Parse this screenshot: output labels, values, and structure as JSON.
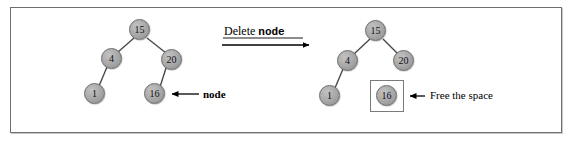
{
  "figure": {
    "caption_operation_prefix": "Delete",
    "caption_operation_target": "node",
    "frame": {
      "border_color": "#6f6f6f"
    },
    "node_fill": "#a6a6a6",
    "node_stroke": "#6a6a6a",
    "edge_color": "#4a4a4a",
    "arrow_color": "#000000"
  },
  "before": {
    "title": "binary-search-tree-before-delete",
    "nodes": [
      {
        "id": "b15",
        "label": "15",
        "x": 140,
        "y": 30
      },
      {
        "id": "b4",
        "label": "4",
        "x": 112,
        "y": 59
      },
      {
        "id": "b20",
        "label": "20",
        "x": 172,
        "y": 60
      },
      {
        "id": "b1",
        "label": "1",
        "x": 95,
        "y": 94
      },
      {
        "id": "b16",
        "label": "16",
        "x": 155,
        "y": 94
      }
    ],
    "edges": [
      {
        "from": "b15",
        "to": "b4"
      },
      {
        "from": "b15",
        "to": "b20"
      },
      {
        "from": "b4",
        "to": "b1"
      },
      {
        "from": "b20",
        "to": "b16"
      }
    ],
    "annotation": {
      "text": "node",
      "style": "mono-bold",
      "arrow_from_x": 199,
      "arrow_to_x": 170,
      "arrow_y": 94,
      "label_x": 202,
      "label_y": 90
    }
  },
  "after": {
    "title": "binary-search-tree-after-delete",
    "nodes": [
      {
        "id": "a15",
        "label": "15",
        "x": 376,
        "y": 31
      },
      {
        "id": "a4",
        "label": "4",
        "x": 348,
        "y": 61
      },
      {
        "id": "a20",
        "label": "20",
        "x": 404,
        "y": 61
      },
      {
        "id": "a1",
        "label": "1",
        "x": 330,
        "y": 96
      },
      {
        "id": "a16",
        "label": "16",
        "x": 387,
        "y": 96
      }
    ],
    "edges": [
      {
        "from": "a15",
        "to": "a4"
      },
      {
        "from": "a15",
        "to": "a20"
      },
      {
        "from": "a4",
        "to": "a1"
      }
    ],
    "detached_box": {
      "x": 370,
      "y": 80,
      "width": 34,
      "height": 32
    },
    "annotation": {
      "text": "Free the space",
      "style": "serif",
      "arrow_from_x": 425,
      "arrow_to_x": 408,
      "arrow_y": 96,
      "label_x": 430,
      "label_y": 91
    }
  },
  "transition": {
    "label_x": 224,
    "label_y": 27,
    "arrow_from_x": 222,
    "arrow_to_x": 311,
    "arrow_y": 45
  }
}
